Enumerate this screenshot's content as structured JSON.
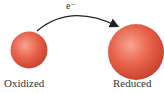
{
  "diagram": {
    "electron_label": "e⁻",
    "left_particle": {
      "label": "Oxidized",
      "color": "#e8614a"
    },
    "right_particle": {
      "label": "Reduced",
      "color": "#e8614a"
    },
    "arrow": {
      "direction": "left-to-right",
      "color": "#222222"
    }
  }
}
